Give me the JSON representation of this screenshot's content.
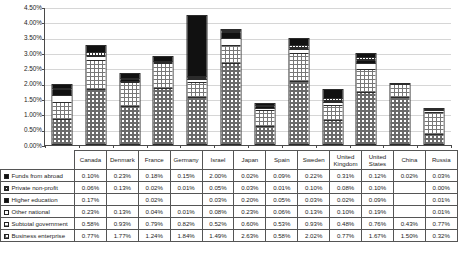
{
  "chart_data": {
    "type": "bar",
    "stacked": true,
    "title": "",
    "xlabel": "",
    "ylabel": "",
    "ylim": [
      0,
      4.5
    ],
    "ytick_labels": [
      "0.00%",
      "0.50%",
      "1.00%",
      "1.50%",
      "2.00%",
      "2.50%",
      "3.00%",
      "3.50%",
      "4.00%",
      "4.50%"
    ],
    "ytick_values": [
      0,
      0.5,
      1.0,
      1.5,
      2.0,
      2.5,
      3.0,
      3.5,
      4.0,
      4.5
    ],
    "grid": true,
    "legend_position": "table-row-headers",
    "categories": [
      "Canada",
      "Denmark",
      "France",
      "Germany",
      "Israel",
      "Japan",
      "Spain",
      "Sweden",
      "United Kingdom",
      "United States",
      "China",
      "Russia"
    ],
    "series": [
      {
        "name": "Business enterprise",
        "pattern": "checkered-gray",
        "values": [
          0.77,
          1.77,
          1.24,
          1.84,
          1.49,
          2.63,
          0.58,
          2.02,
          0.77,
          1.67,
          1.5,
          0.32
        ],
        "labels": [
          "0.77%",
          "1.77%",
          "1.24%",
          "1.84%",
          "1.49%",
          "2.63%",
          "0.58%",
          "2.02%",
          "0.77%",
          "1.67%",
          "1.50%",
          "0.32%"
        ]
      },
      {
        "name": "Subtotal government",
        "pattern": "dotted-light",
        "values": [
          0.58,
          0.93,
          0.79,
          0.82,
          0.52,
          0.6,
          0.53,
          0.93,
          0.48,
          0.76,
          0.43,
          0.77
        ],
        "labels": [
          "0.58%",
          "0.93%",
          "0.79%",
          "0.82%",
          "0.52%",
          "0.60%",
          "0.53%",
          "0.93%",
          "0.48%",
          "0.76%",
          "0.43%",
          "0.77%"
        ]
      },
      {
        "name": "Other national",
        "pattern": "white",
        "values": [
          0.23,
          0.13,
          0.04,
          0.01,
          0.08,
          0.23,
          0.06,
          0.13,
          0.1,
          0.19,
          null,
          0.01
        ],
        "labels": [
          "0.23%",
          "0.13%",
          "0.04%",
          "0.01%",
          "0.08%",
          "0.23%",
          "0.06%",
          "0.13%",
          "0.10%",
          "0.19%",
          "",
          "0.01%"
        ]
      },
      {
        "name": "Higher education",
        "pattern": "black",
        "values": [
          0.17,
          null,
          0.02,
          null,
          0.03,
          0.2,
          0.05,
          0.03,
          0.02,
          0.09,
          null,
          0.01
        ],
        "labels": [
          "0.17%",
          "",
          "0.02%",
          "",
          "0.03%",
          "0.20%",
          "0.05%",
          "0.03%",
          "0.02%",
          "0.09%",
          "",
          "0.01%"
        ]
      },
      {
        "name": "Private non-profit",
        "pattern": "dense-grid",
        "values": [
          0.06,
          0.13,
          0.02,
          0.01,
          0.05,
          0.03,
          0.01,
          0.1,
          0.08,
          0.1,
          null,
          0.0
        ],
        "labels": [
          "0.06%",
          "0.13%",
          "0.02%",
          "0.01%",
          "0.05%",
          "0.03%",
          "0.01%",
          "0.10%",
          "0.08%",
          "0.10%",
          "",
          "0.00%"
        ]
      },
      {
        "name": "Funds from abroad",
        "pattern": "black",
        "values": [
          0.1,
          0.23,
          0.18,
          0.15,
          2.0,
          0.02,
          0.09,
          0.22,
          0.31,
          0.12,
          0.02,
          0.03
        ],
        "labels": [
          "0.10%",
          "0.23%",
          "0.18%",
          "0.15%",
          "2.00%",
          "0.02%",
          "0.09%",
          "0.22%",
          "0.31%",
          "0.12%",
          "0.02%",
          "0.03%"
        ]
      }
    ]
  },
  "table": {
    "corner_label": "",
    "column_headers": [
      "Canada",
      "Denmark",
      "France",
      "Germany",
      "Israel",
      "Japan",
      "Spain",
      "Sweden",
      "United Kingdom",
      "United States",
      "China",
      "Russia"
    ],
    "rows": [
      {
        "label": "Funds from abroad",
        "swatch": "black-swatch",
        "values": [
          "0.10%",
          "0.23%",
          "0.18%",
          "0.15%",
          "2.00%",
          "0.02%",
          "0.09%",
          "0.22%",
          "0.31%",
          "0.12%",
          "0.02%",
          "0.03%"
        ]
      },
      {
        "label": "Private non-profit",
        "swatch": "dense-grid-swatch",
        "values": [
          "0.06%",
          "0.13%",
          "0.02%",
          "0.01%",
          "0.05%",
          "0.03%",
          "0.01%",
          "0.10%",
          "0.08%",
          "0.10%",
          "",
          "0.00%"
        ]
      },
      {
        "label": "Higher education",
        "swatch": "black-swatch",
        "values": [
          "0.17%",
          "",
          "0.02%",
          "",
          "0.03%",
          "0.20%",
          "0.05%",
          "0.03%",
          "0.02%",
          "0.09%",
          "",
          "0.01%"
        ]
      },
      {
        "label": "Other national",
        "swatch": "white-swatch",
        "values": [
          "0.23%",
          "0.13%",
          "0.04%",
          "0.01%",
          "0.08%",
          "0.23%",
          "0.06%",
          "0.13%",
          "0.10%",
          "0.19%",
          "",
          "0.01%"
        ]
      },
      {
        "label": "Subtotal government",
        "swatch": "dotted-light-swatch",
        "values": [
          "0.58%",
          "0.93%",
          "0.79%",
          "0.82%",
          "0.52%",
          "0.60%",
          "0.53%",
          "0.93%",
          "0.48%",
          "0.76%",
          "0.43%",
          "0.77%"
        ]
      },
      {
        "label": "Business enterprise",
        "swatch": "checkered-swatch",
        "values": [
          "0.77%",
          "1.77%",
          "1.24%",
          "1.84%",
          "1.49%",
          "2.63%",
          "0.58%",
          "2.02%",
          "0.77%",
          "1.67%",
          "1.50%",
          "0.32%"
        ]
      }
    ]
  },
  "artifact": {
    "bleed_text": ""
  }
}
